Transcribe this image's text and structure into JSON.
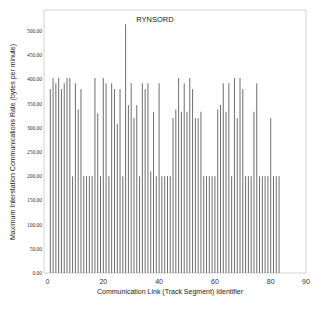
{
  "chart_data": {
    "type": "bar",
    "title": "RYNSORD",
    "xlabel": "Communication Link (Track Segment) Identifier",
    "ylabel": "Maximum Interstation Communications Rate (bytes per minute)",
    "xlim": [
      0,
      90
    ],
    "ylim": [
      0,
      530
    ],
    "xticks": [
      0,
      20,
      40,
      60,
      80,
      90
    ],
    "yticks": [
      0,
      50,
      100,
      150,
      200,
      250,
      300,
      350,
      400,
      450,
      500
    ],
    "ytick_labels": [
      "0.00",
      "50.00",
      "100.00",
      "150.00",
      "200.00",
      "250.00",
      "300.00",
      "350.00",
      "400.00",
      "450.00",
      "500.00"
    ],
    "grid": false,
    "legend": null,
    "bar_color": "#6e6e6e",
    "x": [
      1,
      2,
      3,
      4,
      5,
      6,
      7,
      8,
      9,
      10,
      11,
      12,
      13,
      14,
      15,
      16,
      17,
      18,
      19,
      20,
      21,
      22,
      23,
      24,
      25,
      26,
      27,
      28,
      29,
      30,
      31,
      32,
      33,
      34,
      35,
      36,
      37,
      38,
      39,
      40,
      41,
      42,
      43,
      44,
      45,
      46,
      47,
      48,
      49,
      50,
      51,
      52,
      53,
      54,
      55,
      56,
      57,
      58,
      59,
      60,
      61,
      62,
      63,
      64,
      65,
      66,
      67,
      68,
      69,
      70,
      71,
      72,
      73,
      74,
      75,
      76,
      77,
      78,
      79,
      80,
      81,
      82,
      83
    ],
    "values": [
      380,
      403,
      392,
      403,
      380,
      392,
      403,
      403,
      200,
      392,
      338,
      380,
      200,
      200,
      200,
      200,
      403,
      330,
      200,
      403,
      392,
      200,
      392,
      380,
      308,
      380,
      200,
      514,
      347,
      392,
      320,
      347,
      200,
      392,
      380,
      392,
      210,
      333,
      200,
      392,
      200,
      200,
      200,
      200,
      320,
      338,
      403,
      333,
      392,
      333,
      403,
      380,
      320,
      320,
      333,
      200,
      200,
      200,
      200,
      200,
      338,
      347,
      392,
      333,
      392,
      200,
      403,
      320,
      403,
      380,
      200,
      200,
      200,
      333,
      392,
      200,
      200,
      200,
      200,
      320,
      200,
      200,
      200
    ]
  }
}
